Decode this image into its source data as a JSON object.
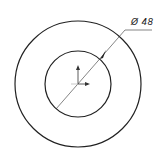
{
  "drawing": {
    "type": "concentric-circles",
    "background": "#ffffff",
    "stroke_color": "#222222",
    "center": [
      78,
      84
    ],
    "outer_circle": {
      "radius": 63
    },
    "inner_circle": {
      "radius": 33
    },
    "dimension": {
      "symbol": "Ø",
      "value": "48",
      "label": "Ø 48",
      "applies_to": "inner-circle"
    },
    "axis_indicator": {
      "icons": [
        "y-axis-arrow-icon",
        "x-axis-arrow-icon"
      ]
    }
  }
}
